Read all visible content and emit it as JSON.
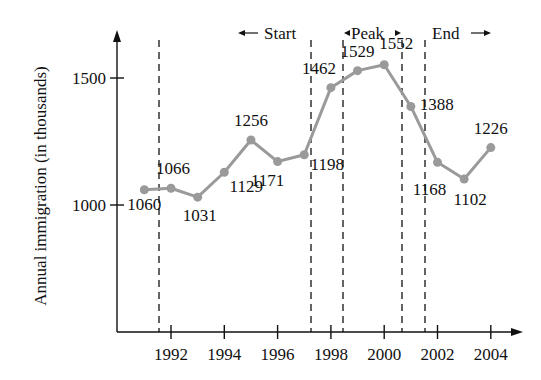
{
  "chart_data": {
    "type": "line",
    "title": "",
    "xlabel": "",
    "ylabel": "Annual immigration (in thousands)",
    "x": [
      1991,
      1992,
      1993,
      1994,
      1995,
      1996,
      1997,
      1998,
      1999,
      2000,
      2001,
      2002,
      2003,
      2004
    ],
    "series": [
      {
        "name": "Annual immigration",
        "values": [
          1060,
          1066,
          1031,
          1129,
          1256,
          1171,
          1198,
          1462,
          1529,
          1552,
          1388,
          1168,
          1102,
          1226
        ],
        "color": "#9a9a9a"
      }
    ],
    "x_ticks": [
      "1992",
      "1994",
      "1996",
      "1998",
      "2000",
      "2002",
      "2004"
    ],
    "y_ticks": [
      "1000",
      "1500"
    ],
    "annotations": {
      "start": "Start",
      "peak": "Peak",
      "end": "End"
    },
    "phase_boundaries": [
      1991.5,
      1997.2,
      1998.4,
      2000.7,
      2001.5
    ],
    "grid": false,
    "legend": "none"
  }
}
